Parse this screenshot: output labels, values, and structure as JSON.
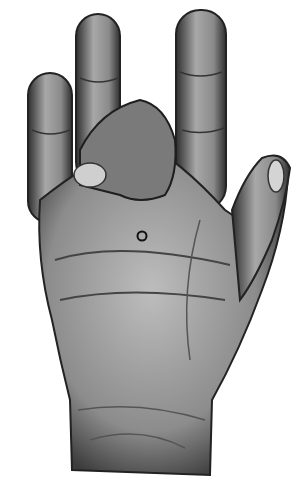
{
  "image": {
    "subject": "hand-palm-illustration",
    "style": "grayscale pencil drawing",
    "gesture": "middle finger bent toward palm, index and ring fingers extended, thumb extended",
    "background_color": "#ffffff",
    "skin_tone_light": "#b8b8b8",
    "skin_tone_mid": "#8a8a8a",
    "skin_tone_dark": "#3a3a3a",
    "marker": {
      "shape": "circle",
      "location": "center of palm",
      "stroke_color": "#111111"
    }
  }
}
